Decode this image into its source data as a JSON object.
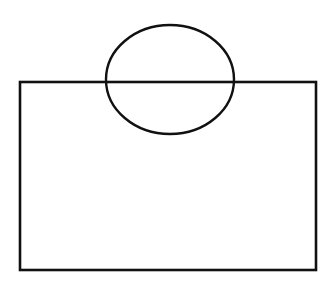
{
  "diagram": {
    "background": "#ffffff",
    "stroke_color": "#111111",
    "stroke_width": 2.6,
    "shapes": [
      {
        "type": "rectangle",
        "name": "rectangle",
        "x": 20,
        "y": 82,
        "width": 296,
        "height": 188
      },
      {
        "type": "ellipse",
        "name": "ellipse",
        "cx": 170,
        "cy": 79.5,
        "rx": 64,
        "ry": 54.5
      }
    ]
  }
}
